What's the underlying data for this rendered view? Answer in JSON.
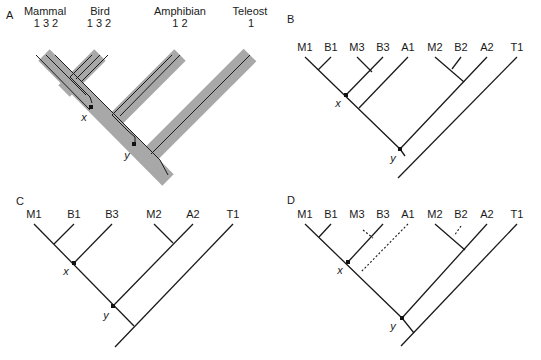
{
  "panels": [
    {
      "id": "A",
      "label": "A",
      "label_pos": [
        6,
        19
      ],
      "type": "species-gene-tree",
      "species": [
        {
          "name": "Mammal",
          "x": 45,
          "y": 15,
          "genes": "1 3 2",
          "genes_x": 46,
          "genes_y": 27
        },
        {
          "name": "Bird",
          "x": 100,
          "y": 15,
          "genes": "1 3 2",
          "genes_x": 99,
          "genes_y": 27
        },
        {
          "name": "Amphibian",
          "x": 180,
          "y": 15,
          "genes": "1 2",
          "genes_x": 180,
          "genes_y": 27
        },
        {
          "name": "Teleost",
          "x": 250,
          "y": 15,
          "genes": "1",
          "genes_x": 251,
          "genes_y": 27
        }
      ],
      "bands": [
        {
          "x1": 44,
          "y1": 55,
          "x2": 168,
          "y2": 180,
          "w": 16
        },
        {
          "x1": 100,
          "y1": 55,
          "x2": 64,
          "y2": 91,
          "w": 16
        },
        {
          "x1": 180,
          "y1": 55,
          "x2": 114,
          "y2": 121,
          "w": 16
        },
        {
          "x1": 250,
          "y1": 55,
          "x2": 150,
          "y2": 155,
          "w": 18
        }
      ],
      "gene_lines": [
        {
          "pts": [
            [
              36,
              55
            ],
            [
              90,
              110
            ]
          ]
        },
        {
          "pts": [
            [
              46,
              55
            ],
            [
              73,
              82
            ],
            [
              86,
              95
            ]
          ]
        },
        {
          "pts": [
            [
              55,
              55
            ],
            [
              160,
              160
            ],
            [
              168,
              175
            ]
          ]
        },
        {
          "pts": [
            [
              92,
              55
            ],
            [
              70,
              77
            ],
            [
              78,
              85
            ],
            [
              90,
              97
            ],
            [
              92,
              103
            ]
          ]
        },
        {
          "pts": [
            [
              100,
              55
            ],
            [
              76,
              79
            ]
          ]
        },
        {
          "pts": [
            [
              108,
              55
            ],
            [
              82,
              81
            ]
          ]
        },
        {
          "pts": [
            [
              172,
              55
            ],
            [
              112,
              115
            ],
            [
              128,
              131
            ],
            [
              135,
              137
            ],
            [
              135,
              143
            ]
          ]
        },
        {
          "pts": [
            [
              180,
              55
            ],
            [
              120,
              116
            ]
          ]
        },
        {
          "pts": [
            [
              250,
              55
            ],
            [
              151,
              154
            ]
          ]
        }
      ],
      "nodes": [
        {
          "name": "x",
          "x": 91,
          "y": 107,
          "lx": 84,
          "ly": 121
        },
        {
          "name": "y",
          "x": 134,
          "y": 144,
          "lx": 127,
          "ly": 159
        }
      ]
    },
    {
      "id": "B",
      "label": "B",
      "label_pos": [
        287,
        23
      ],
      "type": "gene-tree",
      "tips": [
        {
          "name": "M1",
          "x": 305
        },
        {
          "name": "B1",
          "x": 331
        },
        {
          "name": "M3",
          "x": 357
        },
        {
          "name": "B3",
          "x": 383
        },
        {
          "name": "A1",
          "x": 408
        },
        {
          "name": "M2",
          "x": 435
        },
        {
          "name": "B2",
          "x": 461
        },
        {
          "name": "A2",
          "x": 487
        },
        {
          "name": "T1",
          "x": 517
        }
      ],
      "tip_label_y": 51,
      "tip_y": 57,
      "solid": [
        [
          [
            305,
            57
          ],
          [
            400,
            149
          ],
          [
            405,
            156
          ]
        ],
        [
          [
            331,
            57
          ],
          [
            318,
            70
          ]
        ],
        [
          [
            357,
            57
          ],
          [
            372,
            72
          ]
        ],
        [
          [
            383,
            57
          ],
          [
            346,
            95
          ]
        ],
        [
          [
            408,
            57
          ],
          [
            359,
            108
          ]
        ],
        [
          [
            435,
            57
          ],
          [
            464,
            82
          ]
        ],
        [
          [
            461,
            57
          ],
          [
            452,
            69
          ]
        ],
        [
          [
            487,
            57
          ],
          [
            400,
            149
          ]
        ],
        [
          [
            517,
            57
          ],
          [
            398,
            178
          ]
        ]
      ],
      "dashed": [],
      "nodes": [
        {
          "name": "x",
          "x": 346,
          "y": 95,
          "lx": 338,
          "ly": 107
        },
        {
          "name": "y",
          "x": 400,
          "y": 149,
          "lx": 393,
          "ly": 162
        }
      ]
    },
    {
      "id": "C",
      "label": "C",
      "label_pos": [
        16,
        205
      ],
      "type": "gene-tree",
      "tips": [
        {
          "name": "M1",
          "x": 34
        },
        {
          "name": "B1",
          "x": 74
        },
        {
          "name": "B3",
          "x": 112
        },
        {
          "name": "M2",
          "x": 154
        },
        {
          "name": "A2",
          "x": 193
        },
        {
          "name": "T1",
          "x": 233
        }
      ],
      "tip_label_y": 218,
      "tip_y": 224,
      "solid": [
        [
          [
            34,
            224
          ],
          [
            134,
            326
          ]
        ],
        [
          [
            74,
            224
          ],
          [
            54,
            244
          ]
        ],
        [
          [
            112,
            224
          ],
          [
            74,
            263
          ]
        ],
        [
          [
            154,
            224
          ],
          [
            173,
            243
          ]
        ],
        [
          [
            193,
            224
          ],
          [
            113,
            306
          ]
        ],
        [
          [
            233,
            224
          ],
          [
            115,
            347
          ]
        ]
      ],
      "dashed": [],
      "nodes": [
        {
          "name": "x",
          "x": 74,
          "y": 263,
          "lx": 66,
          "ly": 275
        },
        {
          "name": "y",
          "x": 113,
          "y": 306,
          "lx": 106,
          "ly": 319
        }
      ]
    },
    {
      "id": "D",
      "label": "D",
      "label_pos": [
        287,
        204
      ],
      "type": "gene-tree",
      "tips": [
        {
          "name": "M1",
          "x": 305
        },
        {
          "name": "B1",
          "x": 331
        },
        {
          "name": "M3",
          "x": 357
        },
        {
          "name": "B3",
          "x": 383
        },
        {
          "name": "A1",
          "x": 408
        },
        {
          "name": "M2",
          "x": 435
        },
        {
          "name": "B2",
          "x": 461
        },
        {
          "name": "A2",
          "x": 487
        },
        {
          "name": "T1",
          "x": 517
        }
      ],
      "tip_label_y": 218,
      "tip_y": 224,
      "solid": [
        [
          [
            305,
            224
          ],
          [
            402,
            318
          ],
          [
            414,
            333
          ]
        ],
        [
          [
            331,
            224
          ],
          [
            319,
            237
          ]
        ],
        [
          [
            383,
            224
          ],
          [
            348,
            262
          ]
        ],
        [
          [
            435,
            224
          ],
          [
            465,
            250
          ]
        ],
        [
          [
            487,
            224
          ],
          [
            402,
            318
          ]
        ],
        [
          [
            517,
            224
          ],
          [
            401,
            346
          ]
        ]
      ],
      "dashed": [
        [
          [
            363,
            230
          ],
          [
            373,
            238
          ]
        ],
        [
          [
            408,
            224
          ],
          [
            361,
            272
          ]
        ],
        [
          [
            461,
            226
          ],
          [
            454,
            236
          ]
        ]
      ],
      "nodes": [
        {
          "name": "x",
          "x": 348,
          "y": 262,
          "lx": 340,
          "ly": 274
        },
        {
          "name": "y",
          "x": 402,
          "y": 318,
          "lx": 393,
          "ly": 330
        }
      ]
    }
  ]
}
